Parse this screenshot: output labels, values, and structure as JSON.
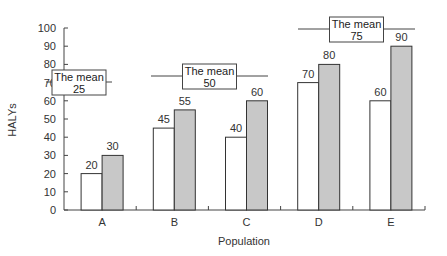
{
  "chart_data": {
    "type": "bar",
    "title": "",
    "xlabel": "Population",
    "ylabel": "HALYs",
    "ylim": [
      0,
      100
    ],
    "yticks": [
      0,
      10,
      20,
      30,
      40,
      50,
      60,
      70,
      80,
      90,
      100
    ],
    "grid": false,
    "categories": [
      "A",
      "B",
      "C",
      "D",
      "E"
    ],
    "series": [
      {
        "name": "series1",
        "color": "#ffffff",
        "values": [
          20,
          45,
          40,
          70,
          60
        ]
      },
      {
        "name": "series2",
        "color": "#c8c8c8",
        "values": [
          30,
          55,
          60,
          80,
          90
        ]
      }
    ],
    "annotations": [
      {
        "text_line1": "The mean",
        "text_line2": "25",
        "y": 58,
        "span": [
          "A",
          "A"
        ]
      },
      {
        "text_line1": "The mean",
        "text_line2": "50",
        "y": 74,
        "span": [
          "B",
          "C"
        ]
      },
      {
        "text_line1": "The mean",
        "text_line2": "75",
        "y": 100,
        "span": [
          "D",
          "E"
        ]
      }
    ]
  }
}
